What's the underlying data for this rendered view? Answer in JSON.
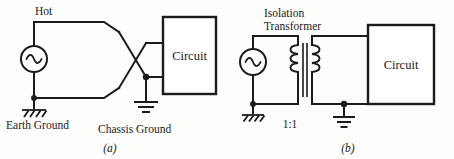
{
  "figure": {
    "panels": [
      {
        "id": "panel-a",
        "caption": "(a)",
        "title": "Direct mains connection with crossed hot and neutral",
        "source_label": "Hot",
        "circuit_box_label": "Circuit",
        "earth_ground_label": "Earth Ground",
        "chassis_ground_label": "Chassis Ground",
        "source_symbol": "ac-source",
        "grounds": [
          "earth-ground",
          "chassis-ground"
        ]
      },
      {
        "id": "panel-b",
        "caption": "(b)",
        "title": "Isolation transformer connection",
        "transformer_label_line1": "Isolation",
        "transformer_label_line2": "Transformer",
        "turns_ratio": "1:1",
        "circuit_box_label": "Circuit",
        "source_symbol": "ac-source",
        "grounds": [
          "earth-ground",
          "chassis-ground"
        ]
      }
    ],
    "colors": {
      "line": "#1b1b1b",
      "background": "#fdfdfb",
      "box_fill": "#ffffff"
    }
  }
}
